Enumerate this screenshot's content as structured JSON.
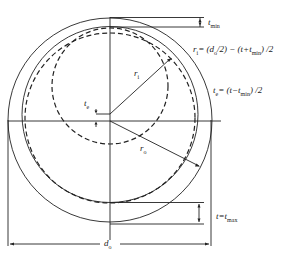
{
  "diagram": {
    "type": "pipe-cross-section-wall-thickness",
    "labels": {
      "t_min": "t",
      "t_min_sub": "min",
      "r_i_formula_lhs": "r",
      "r_i_formula_lhs_sub": "i",
      "r_i_formula_rhs": "= (d",
      "r_i_formula_rhs_sub": "o",
      "r_i_formula_tail1": "/2) − (t+t",
      "r_i_formula_tail1_sub": "min",
      "r_i_formula_tail2": ") /2",
      "t_e_formula_lhs": "t",
      "t_e_formula_lhs_sub": "e",
      "t_e_formula_rhs": "= (t−t",
      "t_e_formula_rhs_sub": "min",
      "t_e_formula_tail": ") /2",
      "r_i": "r",
      "r_i_sub": "i",
      "r_o": "r",
      "r_o_sub": "o",
      "t_e": "t",
      "t_e_sub": "e",
      "t_max_lhs": "t=t",
      "t_max_sub": "max",
      "d_o": "d",
      "d_o_sub": "o"
    },
    "colors": {
      "line": "#222222",
      "background": "#ffffff"
    }
  }
}
